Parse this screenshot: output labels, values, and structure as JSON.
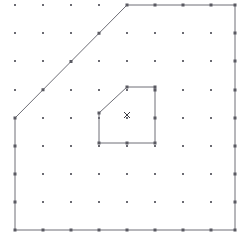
{
  "figure": {
    "width": 249,
    "height": 245,
    "background_color": "#ffffff",
    "line_color": "#6e6e76",
    "dot_color": "#6b6b72",
    "marker_color": "#3a3a40"
  },
  "grid": {
    "columns": 9,
    "rows": 9,
    "x_positions": [
      15,
      43,
      71,
      99,
      127,
      155,
      183,
      211,
      235
    ],
    "y_positions": [
      5,
      33,
      61,
      90,
      118,
      146,
      174,
      202,
      230
    ],
    "dot_size": 2,
    "dot_shape": "square"
  },
  "outer_polygon": {
    "name": "outer-boundary",
    "vertex_count": 5,
    "points": [
      {
        "x": 127,
        "y": 5
      },
      {
        "x": 235,
        "y": 5
      },
      {
        "x": 235,
        "y": 230
      },
      {
        "x": 15,
        "y": 230
      },
      {
        "x": 15,
        "y": 118
      }
    ],
    "points_attr": "127,5 235,5 235,230 15,230 15,118 127,5"
  },
  "inner_polygon": {
    "name": "inner-boundary",
    "vertex_count": 5,
    "points": [
      {
        "x": 127,
        "y": 87
      },
      {
        "x": 155,
        "y": 87
      },
      {
        "x": 155,
        "y": 143
      },
      {
        "x": 99,
        "y": 143
      },
      {
        "x": 99,
        "y": 113
      }
    ],
    "points_attr": "127,87 155,87 155,143 99,143 99,113 127,87"
  },
  "marker": {
    "label": "x",
    "shape": "cross",
    "x": 127,
    "y": 115,
    "size": 6
  }
}
